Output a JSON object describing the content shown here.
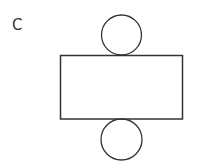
{
  "diagram": {
    "label": "C",
    "stroke_color": "#333333",
    "shapes": {
      "top_circle": {
        "cx": 121.5,
        "cy": 35,
        "r": 20
      },
      "rectangle": {
        "x": 60.5,
        "y": 55.5,
        "width": 122,
        "height": 63.5
      },
      "bottom_circle": {
        "cx": 121.5,
        "cy": 139.5,
        "r": 20.5
      }
    }
  }
}
